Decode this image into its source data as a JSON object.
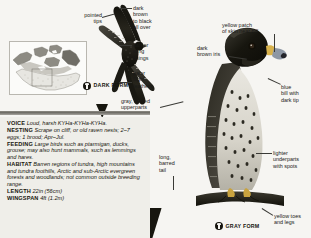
{
  "page": {
    "background_color": "#f6f5f2",
    "ink_color": "#17160f"
  },
  "range_map": {
    "name": "north-america-range-map",
    "caption": ""
  },
  "illustrations": [
    {
      "id": "dark-form-flying",
      "form_label": "DARK\nFORM",
      "pose": "flying, seen from below"
    },
    {
      "id": "gray-form-perched",
      "form_label": "GRAY FORM",
      "pose": "perched, head and body"
    }
  ],
  "callouts": [
    {
      "id": "pointed-tips",
      "text": "pointed\ntips"
    },
    {
      "id": "dark-brown-to-black",
      "text": "dark\nbrown\nto black\nall over"
    },
    {
      "id": "darker-wing-linings",
      "text": "darker\nwing\nlinings"
    },
    {
      "id": "paler-flight-feathers",
      "text": "paler\nflight\nfeathers"
    },
    {
      "id": "gray-barred-upperparts",
      "text": "gray, barred\nupperparts"
    },
    {
      "id": "yellow-patch-skin",
      "text": "yellow patch\nof skin near bill"
    },
    {
      "id": "dark-brown-iris",
      "text": "dark\nbrown iris"
    },
    {
      "id": "blue-bill",
      "text": "blue\nbill with\ndark tip"
    },
    {
      "id": "lighter-underparts",
      "text": "lighter\nunderparts\nwith spots"
    },
    {
      "id": "long-barred-tail",
      "text": "long,\nbarred\ntail"
    },
    {
      "id": "yellow-toes-legs",
      "text": "yellow toes\nand legs"
    }
  ],
  "facts": [
    {
      "key": "VOICE",
      "value": "Loud, harsh KYHa-KYHa-KYHa."
    },
    {
      "key": "NESTING",
      "value": "Scrape on cliff, or old raven nests; 2–7 eggs; 1 brood; Apr–Jul."
    },
    {
      "key": "FEEDING",
      "value": "Large birds such as ptarmigan, ducks, grouse; may also hunt mammals, such as lemmings and hares."
    },
    {
      "key": "HABITAT",
      "value": "Barren regions of tundra, high mountains and tundra foothills, Arctic and sub-Arctic evergreen forests and woodlands; not common outside breeding range."
    },
    {
      "key": "LENGTH",
      "value": "22in (56cm)"
    },
    {
      "key": "WINGSPAN",
      "value": "4ft (1.2m)"
    }
  ]
}
